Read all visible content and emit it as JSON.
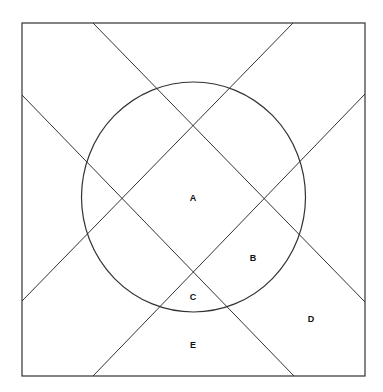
{
  "diagram": {
    "type": "geometric-region-diagram",
    "stroke_color": "#333333",
    "background": "#ffffff",
    "frame": {
      "x": 22,
      "y": 23,
      "width": 343,
      "height": 353
    },
    "circle": {
      "cx": 193.5,
      "cy": 197,
      "rx": 112,
      "ry": 115
    },
    "lines": [
      {
        "x1": 93,
        "y1": 23,
        "x2": 365,
        "y2": 302
      },
      {
        "x1": 22,
        "y1": 95,
        "x2": 294,
        "y2": 376
      },
      {
        "x1": 293,
        "y1": 23,
        "x2": 22,
        "y2": 301
      },
      {
        "x1": 365,
        "y1": 94,
        "x2": 93,
        "y2": 376
      }
    ],
    "labels": [
      {
        "text": "A",
        "x": 193,
        "y": 201
      },
      {
        "text": "B",
        "x": 253,
        "y": 261
      },
      {
        "text": "C",
        "x": 193,
        "y": 300
      },
      {
        "text": "D",
        "x": 311,
        "y": 322
      },
      {
        "text": "E",
        "x": 193,
        "y": 348
      }
    ]
  }
}
